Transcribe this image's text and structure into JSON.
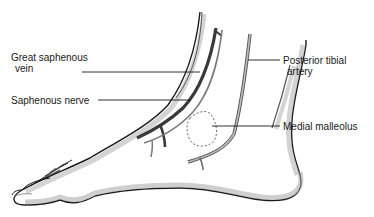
{
  "diagram": {
    "labels": {
      "great_saphenous_vein": {
        "line1": "Great saphenous",
        "line2": "vein"
      },
      "saphenous_nerve": {
        "line1": "Saphenous nerve"
      },
      "posterior_tibial_artery": {
        "line1": "Posterior tibial",
        "line2": "artery"
      },
      "medial_malleolus": {
        "line1": "Medial malleolus"
      }
    },
    "colors": {
      "outline": "#1a1a1a",
      "vein": "#3a3a3a",
      "nerve": "#7a7a7a",
      "artery": "#8a8a8a",
      "shading": "#9a9a9a",
      "background": "#ffffff"
    }
  }
}
